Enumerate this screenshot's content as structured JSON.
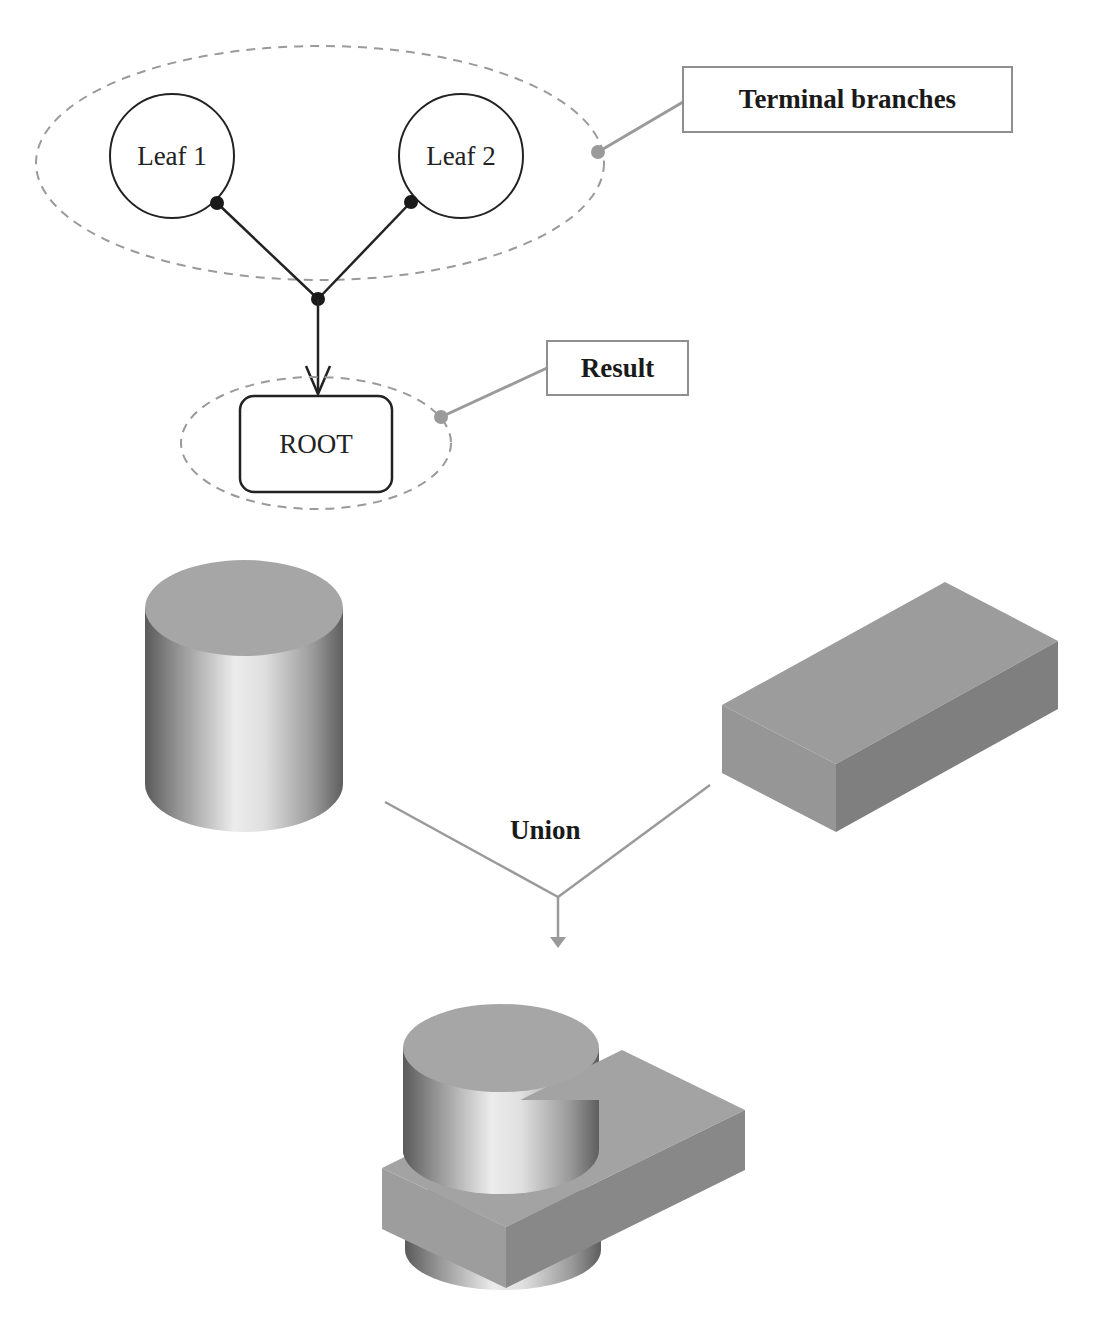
{
  "tree": {
    "nodes": [
      {
        "id": "leaf1",
        "label": "Leaf 1",
        "shape": "circle"
      },
      {
        "id": "leaf2",
        "label": "Leaf 2",
        "shape": "circle"
      },
      {
        "id": "root",
        "label": "ROOT",
        "shape": "rounded-rectangle"
      }
    ],
    "callouts": {
      "terminal": "Terminal branches",
      "result": "Result"
    },
    "edges": [
      {
        "from": "leaf1",
        "to": "junction"
      },
      {
        "from": "leaf2",
        "to": "junction"
      },
      {
        "from": "junction",
        "to": "root",
        "arrow": true
      }
    ]
  },
  "operation": {
    "label": "Union",
    "operands": [
      "cylinder",
      "box"
    ],
    "result": "cylinder-box-union"
  },
  "colors": {
    "line": "#222222",
    "callout_line": "#9a9a9a",
    "dashed": "#9a9a9a",
    "solid_top": "#a3a3a3",
    "solid_side_dark": "#7d7d7d"
  }
}
